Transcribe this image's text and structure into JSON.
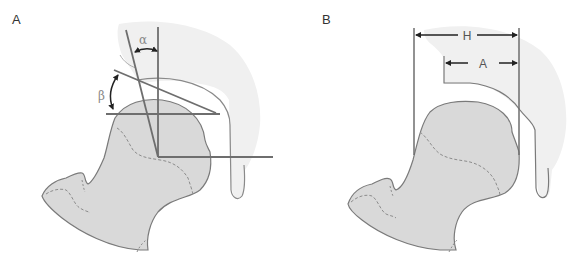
{
  "figure": {
    "panels": [
      {
        "id": "A",
        "label": "A",
        "angles": [
          {
            "symbol": "α",
            "name": "alpha"
          },
          {
            "symbol": "β",
            "name": "beta"
          }
        ]
      },
      {
        "id": "B",
        "label": "B",
        "dimensions": [
          {
            "symbol": "H",
            "name": "head-width"
          },
          {
            "symbol": "A",
            "name": "acetabular-coverage"
          }
        ]
      }
    ]
  },
  "colors": {
    "acetabulum_fill": "#f0f0f0",
    "femur_fill": "#d9d9d9",
    "outline": "#7a7a7a",
    "measure_line": "#6e6e6e",
    "arrow": "#222222",
    "dashed_line": "#8c8c8c"
  }
}
